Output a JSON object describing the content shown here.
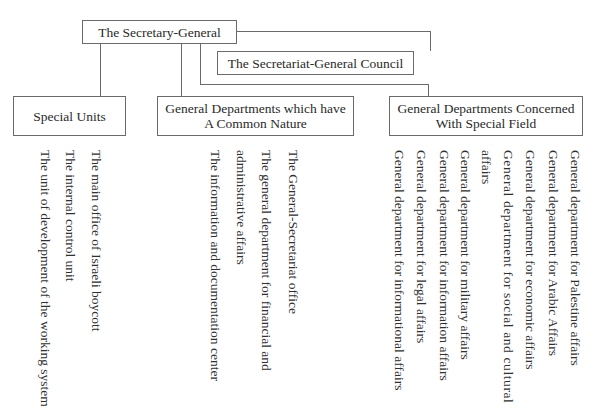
{
  "chart": {
    "root": {
      "label": "The Secretary-General"
    },
    "council": {
      "label": "The Secretariat-General Council"
    },
    "groups": [
      {
        "label_line1": "Special Units",
        "label_line2": "",
        "items": [
          "The main office of Israeli boycott",
          "The internal control unit",
          "The unit of development of the working system"
        ]
      },
      {
        "label_line1": "General Departments which have",
        "label_line2": "A Common Nature",
        "items": [
          "The General-Secretariat office",
          "The general department for financial and",
          "administrative affairs",
          "The information and documentation center"
        ]
      },
      {
        "label_line1": "General Departments Concerned",
        "label_line2": "With Special Field",
        "items": [
          "General department for Palestine affairs",
          "General department for Arabic Affairs",
          "General department for economic affairs",
          "General department for social and cultural",
          "affairs",
          "General department for military affairs",
          "General department for information affairs",
          "General department for legal affairs",
          "General department for informational affairs"
        ]
      }
    ]
  },
  "colors": {
    "line": "#6a6a6a",
    "text": "#2a2a2a",
    "background": "#ffffff"
  }
}
